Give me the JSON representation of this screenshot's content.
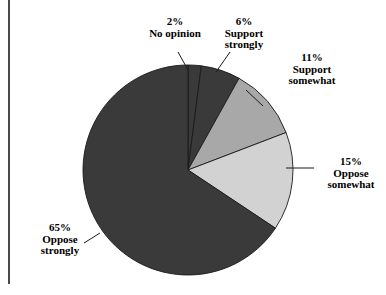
{
  "chart_data": {
    "type": "pie",
    "title": "",
    "categories": [
      "No opinion",
      "Support strongly",
      "Support somewhat",
      "Oppose somewhat",
      "Oppose strongly"
    ],
    "values": [
      2,
      6,
      11,
      15,
      65
    ],
    "value_unit": "%",
    "start_angle_deg": 0,
    "direction": "clockwise",
    "legend": "none",
    "grid": false,
    "slices": [
      {
        "label": "No opinion",
        "percent_text": "2%",
        "value": 2,
        "color": "#3a3a3a"
      },
      {
        "label": "Support strongly",
        "percent_text": "6%",
        "value": 6,
        "color": "#3a3a3a"
      },
      {
        "label": "Support somewhat",
        "percent_text": "11%",
        "value": 11,
        "color": "#a8a8a8"
      },
      {
        "label": "Oppose somewhat",
        "percent_text": "15%",
        "value": 15,
        "color": "#d2d2d2"
      },
      {
        "label": "Oppose strongly",
        "percent_text": "65%",
        "value": 65,
        "color": "#3a3a3a"
      }
    ]
  },
  "labels": {
    "no_opinion": {
      "percent": "2%",
      "line1": "No opinion",
      "line2": ""
    },
    "support_strongly": {
      "percent": "6%",
      "line1": "Support",
      "line2": "strongly"
    },
    "support_somewhat": {
      "percent": "11%",
      "line1": "Support",
      "line2": "somewhat"
    },
    "oppose_somewhat": {
      "percent": "15%",
      "line1": "Oppose",
      "line2": "somewhat"
    },
    "oppose_strongly": {
      "percent": "65%",
      "line1": "Oppose",
      "line2": "strongly"
    }
  },
  "colors": {
    "dark": "#3a3a3a",
    "medium_gray": "#a8a8a8",
    "light_gray": "#d2d2d2",
    "outline": "#1a1a1a",
    "frame": "#4a4a4a",
    "background": "#ffffff"
  },
  "geometry": {
    "center_x": 188,
    "center_y": 170,
    "radius": 105
  }
}
